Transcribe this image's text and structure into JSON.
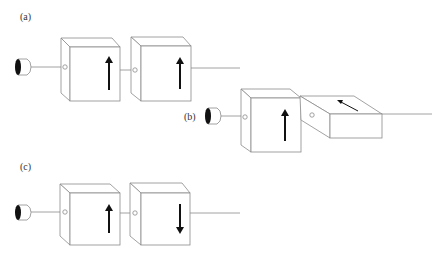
{
  "panels": [
    {
      "id": "a",
      "label": "(a)",
      "polarizer_1": "up",
      "polarizer_2": "up"
    },
    {
      "id": "b",
      "label": "(b)",
      "polarizer_1": "up",
      "polarizer_2": "rotated (tilted arrow on top face)"
    },
    {
      "id": "c",
      "label": "(c)",
      "polarizer_1": "up",
      "polarizer_2": "down"
    }
  ],
  "colors": {
    "line": "#8a8a8a",
    "arrow": "#111111",
    "eye": "#111111",
    "background": "#ffffff"
  },
  "icons": {
    "observer": "eye-icon",
    "polarizer": "cube-box",
    "polarization": "arrow"
  }
}
